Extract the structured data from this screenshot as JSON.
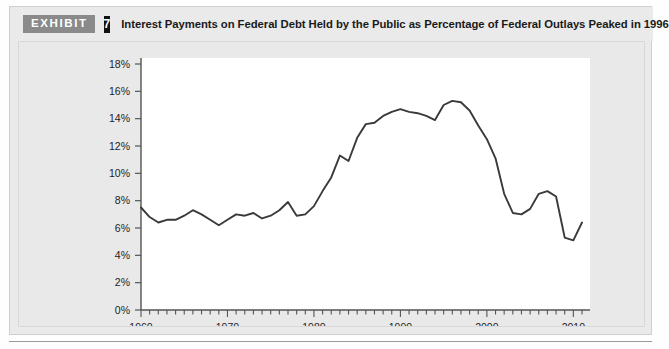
{
  "header": {
    "badge_label": "EXHIBIT",
    "badge_number": "7",
    "title": "Interest Payments on Federal Debt Held by the Public as Percentage of Federal Outlays Peaked in 1996"
  },
  "colors": {
    "panel_background": "#eaeaea",
    "plot_background": "#ffffff",
    "line_color": "#3a3a3a",
    "axis_color": "#555555",
    "badge_exhibit_bg": "#8a8a8a",
    "badge_number_bg": "#111111",
    "text_color": "#1a1a1a"
  },
  "chart_data": {
    "type": "line",
    "title": "Interest Payments on Federal Debt Held by the Public as Percentage of Federal Outlays Peaked in 1996",
    "xlabel": "",
    "ylabel": "",
    "xlim": [
      1960,
      2011
    ],
    "ylim": [
      0,
      18
    ],
    "ytick_labels": [
      "0%",
      "2%",
      "4%",
      "6%",
      "8%",
      "10%",
      "12%",
      "14%",
      "16%",
      "18%"
    ],
    "ytick_values": [
      0,
      2,
      4,
      6,
      8,
      10,
      12,
      14,
      16,
      18
    ],
    "xtick_labels": [
      "1960",
      "1970",
      "1980",
      "1990",
      "2000",
      "2010"
    ],
    "xtick_values": [
      1960,
      1970,
      1980,
      1990,
      2000,
      2010
    ],
    "minor_xtick_step": 1,
    "grid": false,
    "legend": null,
    "annotations": [],
    "series": [
      {
        "name": "Interest Payments as % of Federal Outlays",
        "x": [
          1960,
          1961,
          1962,
          1963,
          1964,
          1965,
          1966,
          1967,
          1968,
          1969,
          1970,
          1971,
          1972,
          1973,
          1974,
          1975,
          1976,
          1977,
          1978,
          1979,
          1980,
          1981,
          1982,
          1983,
          1984,
          1985,
          1986,
          1987,
          1988,
          1989,
          1990,
          1991,
          1992,
          1993,
          1994,
          1995,
          1996,
          1997,
          1998,
          1999,
          2000,
          2001,
          2002,
          2003,
          2004,
          2005,
          2006,
          2007,
          2008,
          2009,
          2010,
          2011
        ],
        "values": [
          7.5,
          6.8,
          6.4,
          6.6,
          6.6,
          6.9,
          7.3,
          7.0,
          6.6,
          6.2,
          6.6,
          7.0,
          6.9,
          7.1,
          6.7,
          6.9,
          7.3,
          7.9,
          6.9,
          7.0,
          7.6,
          8.7,
          9.7,
          11.3,
          10.9,
          12.6,
          13.6,
          13.7,
          14.2,
          14.5,
          14.7,
          14.5,
          14.4,
          14.2,
          13.9,
          15.0,
          15.3,
          15.2,
          14.6,
          13.5,
          12.5,
          11.1,
          8.5,
          7.1,
          7.0,
          7.4,
          8.5,
          8.7,
          8.3,
          5.3,
          5.1,
          6.4
        ]
      }
    ]
  }
}
